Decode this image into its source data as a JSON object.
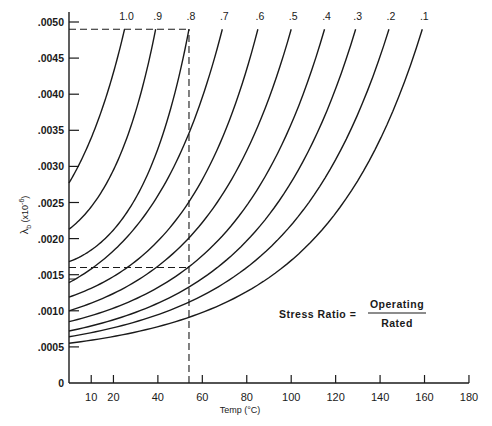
{
  "chart_data": {
    "type": "line",
    "title": "",
    "xlabel": "Temp (°C)",
    "ylabel": "λb (x10⁻⁶)",
    "xlim": [
      0,
      180
    ],
    "ylim": [
      0,
      0.005
    ],
    "grid": false,
    "x_ticks": [
      10,
      20,
      40,
      60,
      80,
      100,
      120,
      140,
      160,
      180
    ],
    "x_tick_labels": [
      "10",
      "20",
      "40",
      "60",
      "80",
      "100",
      "120",
      "140",
      "160",
      "180"
    ],
    "y_ticks": [
      0,
      0.0005,
      0.001,
      0.0015,
      0.002,
      0.0025,
      0.003,
      0.0035,
      0.004,
      0.0045,
      0.005
    ],
    "y_tick_labels": [
      "0",
      ".0005",
      ".0010",
      ".0015",
      ".0020",
      ".0025",
      ".0030",
      ".0035",
      ".0040",
      ".0045",
      ".0050"
    ],
    "legend_position": "curve labels at top of each curve",
    "series": [
      {
        "name": "1.0",
        "x": [
          0,
          20,
          25
        ],
        "values": [
          0.00277,
          0.0043,
          0.0049
        ]
      },
      {
        "name": ".9",
        "x": [
          0,
          20,
          39
        ],
        "values": [
          0.00213,
          0.00295,
          0.0049
        ]
      },
      {
        "name": ".8",
        "x": [
          0,
          20,
          54
        ],
        "values": [
          0.00168,
          0.00212,
          0.0049
        ]
      },
      {
        "name": ".7",
        "x": [
          0,
          54,
          69
        ],
        "values": [
          0.00139,
          0.00346,
          0.0049
        ]
      },
      {
        "name": ".6",
        "x": [
          0,
          54,
          85
        ],
        "values": [
          0.00119,
          0.00251,
          0.0049
        ]
      },
      {
        "name": ".5",
        "x": [
          0,
          54,
          100
        ],
        "values": [
          0.001,
          0.00201,
          0.0049
        ]
      },
      {
        "name": ".4",
        "x": [
          0,
          54,
          115
        ],
        "values": [
          0.00085,
          0.00161,
          0.0049
        ]
      },
      {
        "name": ".3",
        "x": [
          0,
          54,
          129
        ],
        "values": [
          0.00072,
          0.00133,
          0.0049
        ]
      },
      {
        "name": ".2",
        "x": [
          0,
          54,
          144
        ],
        "values": [
          0.00064,
          0.00112,
          0.0049
        ]
      },
      {
        "name": ".1",
        "x": [
          0,
          54,
          159
        ],
        "values": [
          0.00055,
          0.00091,
          0.0049
        ]
      }
    ],
    "reference_lines": [
      {
        "type": "horizontal",
        "y": 0.0049,
        "x_from": 0,
        "x_to": 54,
        "style": "dashed"
      },
      {
        "type": "vertical",
        "x": 54,
        "y_from": 0,
        "y_to": 0.0049,
        "style": "dashed"
      },
      {
        "type": "horizontal",
        "y": 0.0016,
        "x_from": 0,
        "x_to": 54,
        "style": "dashed"
      }
    ],
    "annotations": [
      {
        "text": "Stress Ratio =",
        "fraction_numerator": "Operating",
        "fraction_denominator": "Rated"
      }
    ]
  },
  "labels": {
    "xlabel": "Temp (°C)",
    "ylabel_main": "λ",
    "ylabel_sub": "b",
    "ylabel_rest": " (x10",
    "ylabel_exp": "-6",
    "ylabel_close": ")",
    "stress_ratio": "Stress Ratio  =",
    "operating": "Operating",
    "rated": "Rated"
  }
}
